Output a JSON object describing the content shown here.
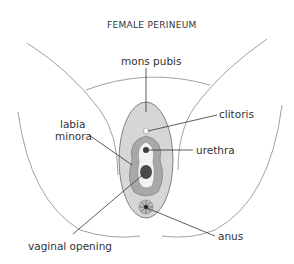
{
  "diagram": {
    "title": "FEMALE PERINEUM",
    "labels": {
      "mons_pubis": "mons pubis",
      "clitoris": "clitoris",
      "labia_minora_line1": "labia",
      "labia_minora_line2": "minora",
      "urethra": "urethra",
      "vaginal_opening": "vaginal opening",
      "anus": "anus"
    },
    "colors": {
      "outer_fill": "#d6d6d6",
      "labia_fill": "#a8a8a8",
      "inner_fill": "#f2f2f2",
      "dark": "#3a3a3a",
      "line": "#555555"
    }
  }
}
